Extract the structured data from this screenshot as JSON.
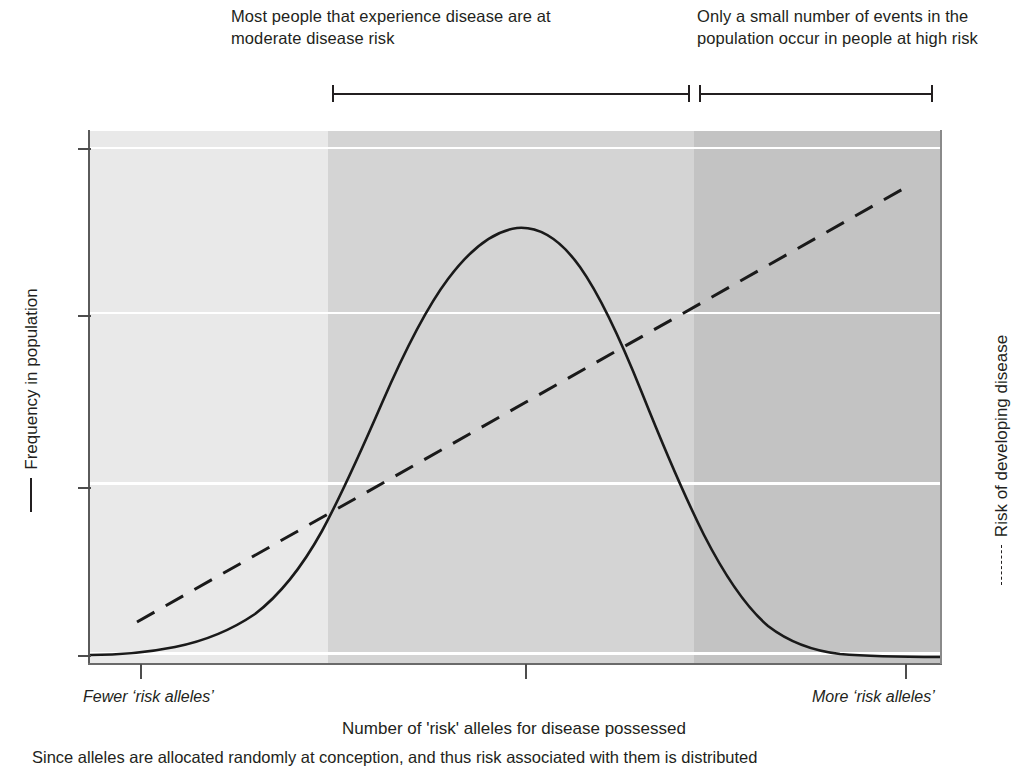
{
  "annotations": {
    "moderate": "Most people that experience disease are at moderate disease risk",
    "high": "Only a small number of events in the population occur in people at high risk"
  },
  "axes": {
    "left_label": "Frequency in population",
    "right_label": "Risk of developing disease",
    "x_label": "Number of 'risk' alleles for disease possessed",
    "x_start_label": "Fewer ‘risk alleles’",
    "x_end_label": "More ‘risk alleles’"
  },
  "caption": "Since alleles are allocated randomly at conception, and thus risk associated with them is distributed",
  "icons": {
    "solid_line_legend": "solid-line-icon",
    "dashed_line_legend": "dashed-line-icon",
    "bracket_left_cap": "bracket-cap-icon",
    "bracket_right_cap": "bracket-cap-icon"
  },
  "colors": {
    "band_low": "#e9e9e9",
    "band_mid": "#d4d4d4",
    "band_high": "#c3c3c3",
    "ink": "#231f20",
    "gridline": "#ffffff"
  },
  "chart_data": {
    "type": "line",
    "title": "",
    "xlabel": "Number of 'risk' alleles for disease possessed",
    "ylabel": "Frequency in population",
    "y2label": "Risk of developing disease",
    "grid": true,
    "legend_position": "axis-titles",
    "xlim": [
      0,
      100
    ],
    "ylim": [
      0,
      100
    ],
    "x_ticks": [
      6,
      51,
      96
    ],
    "x_tick_labels": [
      "",
      "",
      ""
    ],
    "y_gridlines": [
      97,
      66,
      34,
      2
    ],
    "risk_bands": [
      {
        "name": "low risk",
        "x_from": 0,
        "x_to": 28,
        "shade": "#e9e9e9"
      },
      {
        "name": "moderate risk",
        "x_from": 28,
        "x_to": 71,
        "shade": "#d4d4d4"
      },
      {
        "name": "high risk",
        "x_from": 71,
        "x_to": 100,
        "shade": "#c3c3c3"
      }
    ],
    "series": [
      {
        "name": "Frequency in population",
        "style": "solid",
        "x": [
          0,
          4,
          8,
          12,
          16,
          20,
          24,
          28,
          32,
          36,
          40,
          44,
          48,
          50,
          52,
          56,
          60,
          64,
          68,
          72,
          76,
          80,
          84,
          88,
          92,
          96,
          100
        ],
        "y": [
          1.0,
          1.1,
          1.4,
          2.1,
          3.3,
          5.6,
          9.6,
          16.0,
          25.6,
          38.5,
          54.0,
          70.0,
          84.0,
          89.5,
          92.0,
          88.0,
          76.0,
          60.0,
          43.0,
          28.0,
          17.0,
          9.6,
          5.4,
          3.2,
          2.0,
          1.4,
          1.0
        ]
      },
      {
        "name": "Risk of developing disease",
        "style": "dashed",
        "x": [
          6,
          20,
          35,
          50,
          65,
          80,
          96
        ],
        "y": [
          8.5,
          23.0,
          38.0,
          53.0,
          67.0,
          81.0,
          94.0
        ]
      }
    ],
    "annotations": [
      {
        "text": "Most people that experience disease are at moderate disease risk",
        "x_from": 28,
        "x_to": 71,
        "placement": "above-plot"
      },
      {
        "text": "Only a small number of events in the population occur in people at high risk",
        "x_from": 72,
        "x_to": 99,
        "placement": "above-plot"
      }
    ]
  }
}
